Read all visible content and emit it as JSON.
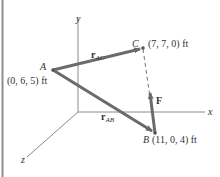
{
  "diagram": {
    "type": "3d-position-vector-figure",
    "axes": {
      "x_label": "x",
      "y_label": "y",
      "z_label": "z"
    },
    "points": {
      "A": {
        "name": "A",
        "coords": "(0, 6, 5) ft"
      },
      "B": {
        "name": "B",
        "coords": "(11, 0, 4) ft"
      },
      "C": {
        "name": "C",
        "coords": "(7, 7, 0) ft"
      }
    },
    "vectors": {
      "r_AC": {
        "main": "r",
        "sub": "AC"
      },
      "r_AB": {
        "main": "r",
        "sub": "AB"
      },
      "F": {
        "main": "F"
      }
    },
    "colors": {
      "vector": "#6b6b6b",
      "axis": "#8a8a8a",
      "text": "#333333",
      "border": "#8c8c8c"
    }
  }
}
